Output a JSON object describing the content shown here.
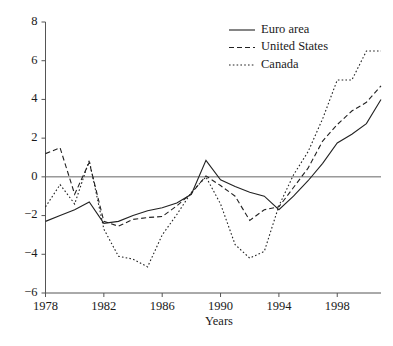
{
  "chart_data": {
    "type": "line",
    "title": "",
    "subtitle": "",
    "xlabel": "Years",
    "ylabel": "",
    "xlim": [
      1978,
      2001
    ],
    "ylim": [
      -6,
      8
    ],
    "xticks": [
      1978,
      1982,
      1986,
      1990,
      1994,
      1998
    ],
    "xtick_labels": [
      "1978",
      "1982",
      "1986",
      "1990",
      "1994",
      "1998"
    ],
    "yticks": [
      -6,
      -4,
      -2,
      0,
      2,
      4,
      6,
      8
    ],
    "ytick_labels": [
      "-6",
      "-4",
      "-2",
      "0",
      "2",
      "4",
      "6",
      "8"
    ],
    "grid": false,
    "zero_line": true,
    "legend_position": "top-right",
    "x": [
      1978,
      1979,
      1980,
      1981,
      1982,
      1983,
      1984,
      1985,
      1986,
      1987,
      1988,
      1989,
      1990,
      1991,
      1992,
      1993,
      1994,
      1995,
      1996,
      1997,
      1998,
      1999,
      2000,
      2001
    ],
    "series": [
      {
        "name": "Euro area",
        "style": "solid",
        "color": "#222222",
        "values": [
          -2.3,
          -2.0,
          -1.7,
          -1.3,
          -2.4,
          -2.3,
          -2.0,
          -1.75,
          -1.6,
          -1.35,
          -0.9,
          0.85,
          -0.15,
          -0.5,
          -0.8,
          -1.0,
          -1.7,
          -1.0,
          -0.2,
          0.7,
          1.75,
          2.2,
          2.75,
          4.0
        ]
      },
      {
        "name": "United States",
        "style": "dashed",
        "color": "#222222",
        "values": [
          1.2,
          1.5,
          -0.9,
          0.75,
          -2.3,
          -2.55,
          -2.2,
          -2.1,
          -2.05,
          -1.5,
          -0.85,
          0.05,
          -0.45,
          -1.0,
          -2.25,
          -1.7,
          -1.55,
          -0.55,
          0.45,
          1.85,
          2.7,
          3.4,
          3.85,
          4.7
        ]
      },
      {
        "name": "Canada",
        "style": "dotted",
        "color": "#222222",
        "values": [
          -1.55,
          -0.4,
          -1.4,
          0.85,
          -2.7,
          -4.1,
          -4.25,
          -4.65,
          -3.0,
          -1.95,
          -0.8,
          0.0,
          -1.4,
          -3.5,
          -4.2,
          -3.85,
          -1.5,
          0.1,
          1.3,
          3.0,
          5.0,
          5.0,
          6.5,
          6.5
        ]
      }
    ]
  },
  "legend": {
    "items": [
      {
        "label": "Euro area"
      },
      {
        "label": "United States"
      },
      {
        "label": "Canada"
      }
    ]
  }
}
